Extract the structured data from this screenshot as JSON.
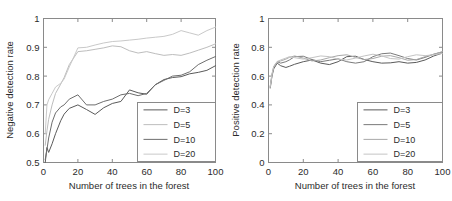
{
  "figure": {
    "background_color": "#ffffff",
    "panels": [
      "negative-detection-rate",
      "positive-detection-rate"
    ]
  },
  "chart_data": [
    {
      "id": "left",
      "type": "line",
      "title": "",
      "xlabel": "Number of trees in the forest",
      "ylabel": "Negative detection rate",
      "xlim": [
        0,
        100
      ],
      "ylim": [
        0.5,
        1
      ],
      "xticks": [
        0,
        20,
        40,
        60,
        80,
        100
      ],
      "yticks": [
        0.5,
        0.6,
        0.7,
        0.8,
        0.9,
        1
      ],
      "xticklabels": [
        "0",
        "20",
        "40",
        "60",
        "80",
        "100"
      ],
      "yticklabels": [
        "0.5",
        "0.6",
        "0.7",
        "0.8",
        "0.9",
        "1"
      ],
      "grid": false,
      "legend_position": "lower right",
      "x": [
        1,
        2,
        3,
        5,
        7,
        10,
        12,
        15,
        20,
        25,
        30,
        35,
        40,
        45,
        50,
        55,
        60,
        65,
        70,
        75,
        80,
        85,
        90,
        95,
        100
      ],
      "series": [
        {
          "name": "D=3",
          "color": "#5a5a5a",
          "values": [
            0.5,
            0.552,
            0.535,
            0.565,
            0.6,
            0.645,
            0.668,
            0.688,
            0.7,
            0.684,
            0.667,
            0.69,
            0.705,
            0.712,
            0.752,
            0.742,
            0.737,
            0.77,
            0.788,
            0.795,
            0.798,
            0.808,
            0.813,
            0.82,
            0.836
          ]
        },
        {
          "name": "D=5",
          "color": "#bdbdbd",
          "values": [
            0.56,
            0.61,
            0.65,
            0.7,
            0.74,
            0.772,
            0.795,
            0.84,
            0.885,
            0.888,
            0.893,
            0.898,
            0.905,
            0.902,
            0.888,
            0.88,
            0.885,
            0.878,
            0.872,
            0.875,
            0.872,
            0.88,
            0.89,
            0.9,
            0.912
          ]
        },
        {
          "name": "D=10",
          "color": "#6e6e6e",
          "values": [
            0.51,
            0.545,
            0.585,
            0.64,
            0.672,
            0.693,
            0.7,
            0.72,
            0.735,
            0.7,
            0.7,
            0.712,
            0.72,
            0.735,
            0.74,
            0.732,
            0.74,
            0.77,
            0.785,
            0.8,
            0.803,
            0.815,
            0.84,
            0.855,
            0.868
          ]
        },
        {
          "name": "D=20",
          "color": "#c9c9c9",
          "values": [
            0.6,
            0.7,
            0.718,
            0.74,
            0.762,
            0.775,
            0.79,
            0.832,
            0.898,
            0.9,
            0.908,
            0.915,
            0.92,
            0.922,
            0.925,
            0.928,
            0.932,
            0.935,
            0.938,
            0.945,
            0.958,
            0.95,
            0.942,
            0.958,
            0.97
          ]
        }
      ]
    },
    {
      "id": "right",
      "type": "line",
      "title": "",
      "xlabel": "Number of trees in the forest",
      "ylabel": "Positive detection rate",
      "xlim": [
        0,
        100
      ],
      "ylim": [
        0,
        1
      ],
      "xticks": [
        0,
        20,
        40,
        60,
        80,
        100
      ],
      "yticks": [
        0,
        0.2,
        0.4,
        0.6,
        0.8,
        1
      ],
      "xticklabels": [
        "0",
        "20",
        "40",
        "60",
        "80",
        "100"
      ],
      "yticklabels": [
        "0",
        "0.2",
        "0.4",
        "0.6",
        "0.8",
        "1"
      ],
      "grid": false,
      "legend_position": "lower right",
      "x": [
        1,
        2,
        3,
        5,
        7,
        10,
        12,
        15,
        20,
        25,
        30,
        35,
        40,
        45,
        50,
        55,
        60,
        65,
        70,
        75,
        80,
        85,
        90,
        95,
        100
      ],
      "series": [
        {
          "name": "D=3",
          "color": "#5a5a5a",
          "values": [
            0.52,
            0.6,
            0.65,
            0.69,
            0.672,
            0.66,
            0.668,
            0.682,
            0.7,
            0.712,
            0.69,
            0.68,
            0.7,
            0.735,
            0.738,
            0.715,
            0.7,
            0.69,
            0.692,
            0.7,
            0.69,
            0.695,
            0.712,
            0.74,
            0.76
          ]
        },
        {
          "name": "D=5",
          "color": "#7a7a7a",
          "values": [
            0.528,
            0.61,
            0.665,
            0.7,
            0.69,
            0.7,
            0.712,
            0.735,
            0.738,
            0.715,
            0.7,
            0.71,
            0.72,
            0.7,
            0.69,
            0.7,
            0.735,
            0.755,
            0.76,
            0.742,
            0.722,
            0.712,
            0.73,
            0.752,
            0.768
          ]
        },
        {
          "name": "D=10",
          "color": "#a8a8a8",
          "values": [
            0.515,
            0.605,
            0.66,
            0.698,
            0.705,
            0.718,
            0.73,
            0.74,
            0.725,
            0.705,
            0.712,
            0.728,
            0.742,
            0.748,
            0.73,
            0.715,
            0.722,
            0.738,
            0.742,
            0.728,
            0.71,
            0.715,
            0.735,
            0.752,
            0.77
          ]
        },
        {
          "name": "D=20",
          "color": "#c4c4c4",
          "values": [
            0.53,
            0.615,
            0.668,
            0.702,
            0.712,
            0.725,
            0.735,
            0.728,
            0.718,
            0.728,
            0.74,
            0.735,
            0.718,
            0.712,
            0.725,
            0.74,
            0.752,
            0.74,
            0.722,
            0.718,
            0.735,
            0.748,
            0.742,
            0.748,
            0.758
          ]
        }
      ]
    }
  ]
}
